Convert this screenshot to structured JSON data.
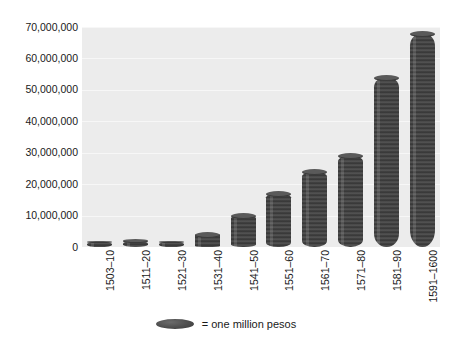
{
  "chart_data": {
    "type": "bar",
    "title": "",
    "subtitle": "",
    "xlabel": "",
    "ylabel": "",
    "grid": true,
    "legend_position": "bottom",
    "ylim": [
      0,
      70000000
    ],
    "categories": [
      "1503–10",
      "1511–20",
      "1521–30",
      "1531–40",
      "1541–50",
      "1551–60",
      "1561–70",
      "1571–80",
      "1581–90",
      "1591–1600"
    ],
    "values": [
      1000000,
      2000000,
      1500000,
      4000000,
      10000000,
      17000000,
      24000000,
      29000000,
      54000000,
      68000000
    ],
    "ytick_labels": [
      "0",
      "10,000,000",
      "20,000,000",
      "30,000,000",
      "40,000,000",
      "50,000,000",
      "60,000,000",
      "70,000,000"
    ],
    "ytick_values": [
      0,
      10000000,
      20000000,
      30000000,
      40000000,
      50000000,
      60000000,
      70000000
    ],
    "legend": [
      {
        "label": "= one million pesos",
        "marker": "ellipse",
        "color": "#4a4a4a"
      }
    ],
    "annotations": []
  },
  "style": {
    "plot_background": "#ececec",
    "page_background": "#ffffff",
    "bar_color": "#4a4a4a",
    "bar_highlight": "#5a5a5a",
    "gridline_color": "#f7f7f7",
    "text_color": "#1a1a1a"
  }
}
